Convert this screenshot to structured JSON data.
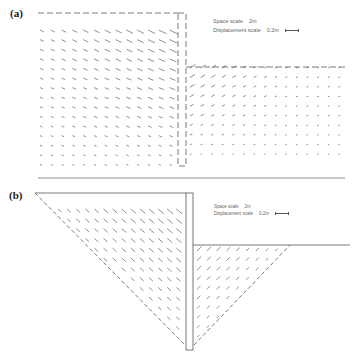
{
  "figure": {
    "panels": [
      {
        "id": "a",
        "label": "(a)",
        "legend": {
          "space_scale_label": "Space scale",
          "space_scale_value": "2m",
          "displacement_scale_label": "Displacement scale",
          "displacement_scale_value": "0.2m"
        },
        "description": "Displacement vector field around retaining wall - full mesh"
      },
      {
        "id": "b",
        "label": "(b)",
        "legend": {
          "space_scale_label": "Space scale",
          "space_scale_value": "2m",
          "displacement_scale_label": "Displacement scale",
          "displacement_scale_value": "0.2m"
        },
        "description": "Displacement vector field within triangular active/passive wedges"
      }
    ],
    "colors": {
      "line": "#555555",
      "vector": "#444444",
      "text": "#666666"
    }
  }
}
